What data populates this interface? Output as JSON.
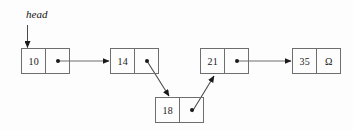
{
  "diagram": {
    "head_label": "head",
    "null_symbol": "Ω",
    "line_color": "#6e6e6e",
    "text_color": "#1a1a1a",
    "background_color": "#fdfdfd",
    "nodes": [
      {
        "id": "node-10",
        "value": "10",
        "x": 21,
        "y": 48,
        "kind": "data-pointer"
      },
      {
        "id": "node-14",
        "value": "14",
        "x": 110,
        "y": 48,
        "kind": "data-pointer"
      },
      {
        "id": "node-21",
        "value": "21",
        "x": 200,
        "y": 48,
        "kind": "data-pointer"
      },
      {
        "id": "node-35",
        "value": "35",
        "x": 292,
        "y": 48,
        "kind": "data-null"
      },
      {
        "id": "node-18",
        "value": "18",
        "x": 155,
        "y": 97,
        "kind": "data-pointer"
      }
    ],
    "links": [
      {
        "from": "head",
        "to": "node-10",
        "style": "straight-down"
      },
      {
        "from": "node-10",
        "to": "node-14",
        "style": "straight-right"
      },
      {
        "from": "node-14",
        "to": "node-18",
        "style": "diagonal-down-right"
      },
      {
        "from": "node-18",
        "to": "node-21",
        "style": "diagonal-up-left"
      },
      {
        "from": "node-21",
        "to": "node-35",
        "style": "straight-right"
      }
    ],
    "terminator": {
      "node": "node-35",
      "symbol": "Ω",
      "meaning": "null-terminator"
    }
  }
}
